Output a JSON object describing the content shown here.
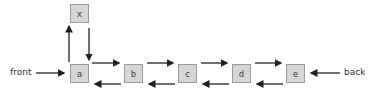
{
  "diagram": {
    "type": "doubly-linked-list-insertion",
    "inserted_node": "x",
    "nodes": [
      "a",
      "b",
      "c",
      "d",
      "e"
    ],
    "front_label": "front",
    "back_label": "back",
    "colors": {
      "node_fill": "#d6d6d6",
      "node_border": "#9a9a9a",
      "arrow": "#222222"
    }
  }
}
